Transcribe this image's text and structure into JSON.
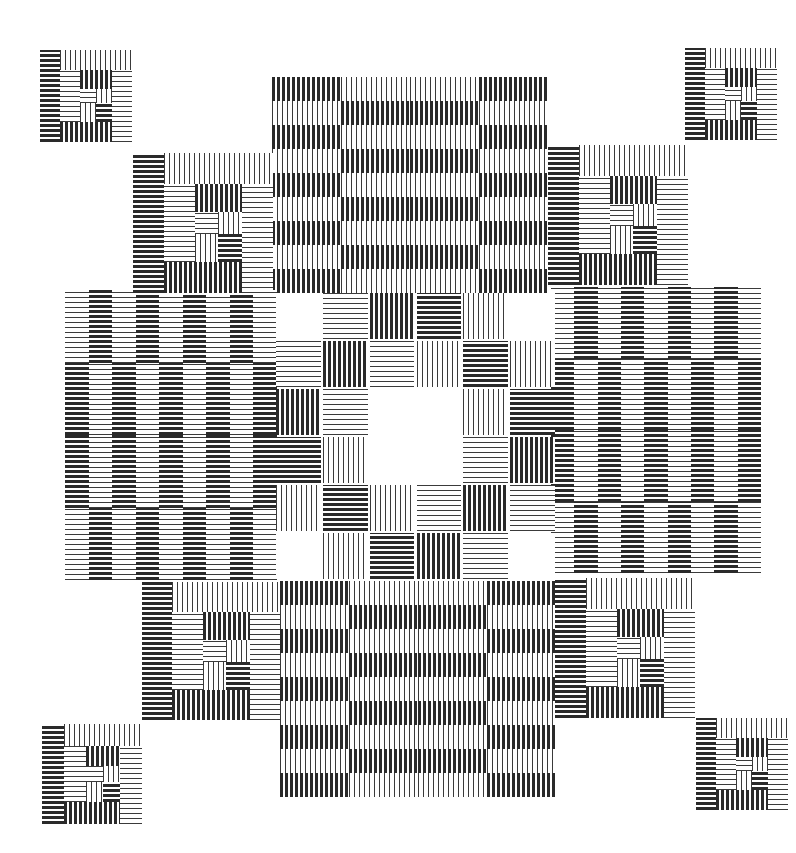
{
  "artwork": {
    "description": "Black and white op-art composition of striped squares and bands",
    "palette": {
      "ink": "#2a2a2a",
      "paper": "#ffffff"
    },
    "bands": [
      {
        "name": "top-band",
        "x": 272,
        "y": 77,
        "w": 276,
        "h": 216,
        "orientation": "v",
        "cols": 2,
        "rows": 9,
        "split": "horizontal"
      },
      {
        "name": "bottom-band",
        "x": 280,
        "y": 581,
        "w": 276,
        "h": 216,
        "orientation": "v",
        "cols": 2,
        "rows": 9,
        "split": "horizontal"
      },
      {
        "name": "left-band",
        "x": 65,
        "y": 290,
        "w": 212,
        "h": 290,
        "orientation": "h",
        "cols": 9,
        "rows": 2,
        "split": "vertical"
      },
      {
        "name": "right-band",
        "x": 551,
        "y": 287,
        "w": 210,
        "h": 286,
        "orientation": "h",
        "cols": 9,
        "rows": 2,
        "split": "vertical"
      }
    ],
    "center_grid": {
      "x": 275,
      "y": 292,
      "w": 281,
      "h": 288,
      "rows": 6,
      "cols": 6,
      "cells": [
        [
          "blank",
          "h-thin",
          "v-thick",
          "h-thick",
          "v-thin",
          "blank"
        ],
        [
          "h-thin",
          "v-thick",
          "h-thin",
          "v-thin",
          "h-thick",
          "v-thin"
        ],
        [
          "v-thick",
          "h-thin",
          "blank",
          "blank",
          "v-thin",
          "h-thick"
        ],
        [
          "h-thick",
          "v-thin",
          "blank",
          "blank",
          "h-thin",
          "v-thick"
        ],
        [
          "v-thin",
          "h-thick",
          "v-thin",
          "h-thin",
          "v-thick",
          "h-thin"
        ],
        [
          "blank",
          "v-thin",
          "h-thick",
          "v-thick",
          "h-thin",
          "blank"
        ]
      ]
    },
    "corner_blocks": [
      {
        "name": "corner-top-left-outer",
        "x": 40,
        "y": 50,
        "s": 92
      },
      {
        "name": "corner-top-left-inner",
        "x": 133,
        "y": 153,
        "s": 140
      },
      {
        "name": "corner-top-right-outer",
        "x": 685,
        "y": 48,
        "s": 92
      },
      {
        "name": "corner-top-right-inner",
        "x": 548,
        "y": 145,
        "s": 140
      },
      {
        "name": "corner-bottom-left-inner",
        "x": 142,
        "y": 582,
        "s": 138
      },
      {
        "name": "corner-bottom-left-outer",
        "x": 42,
        "y": 724,
        "s": 100
      },
      {
        "name": "corner-bottom-right-inner",
        "x": 555,
        "y": 578,
        "s": 140
      },
      {
        "name": "corner-bottom-right-outer",
        "x": 696,
        "y": 718,
        "s": 92
      }
    ],
    "corner_pattern": [
      {
        "x": 0,
        "y": 0,
        "w": 0.22,
        "h": 1.0,
        "t": "h-thick"
      },
      {
        "x": 0.22,
        "y": 0,
        "w": 0.78,
        "h": 0.22,
        "t": "v-thin"
      },
      {
        "x": 0.22,
        "y": 0.22,
        "w": 0.22,
        "h": 0.56,
        "t": "h-thin"
      },
      {
        "x": 0.44,
        "y": 0.22,
        "w": 0.34,
        "h": 0.2,
        "t": "v-thick"
      },
      {
        "x": 0.78,
        "y": 0.22,
        "w": 0.22,
        "h": 0.78,
        "t": "h-thin"
      },
      {
        "x": 0.44,
        "y": 0.42,
        "w": 0.17,
        "h": 0.16,
        "t": "h-thin"
      },
      {
        "x": 0.61,
        "y": 0.42,
        "w": 0.17,
        "h": 0.16,
        "t": "v-thin"
      },
      {
        "x": 0.44,
        "y": 0.58,
        "w": 0.17,
        "h": 0.2,
        "t": "v-thin"
      },
      {
        "x": 0.61,
        "y": 0.58,
        "w": 0.17,
        "h": 0.2,
        "t": "h-thick"
      },
      {
        "x": 0.22,
        "y": 0.78,
        "w": 0.56,
        "h": 0.22,
        "t": "v-thick"
      }
    ]
  }
}
